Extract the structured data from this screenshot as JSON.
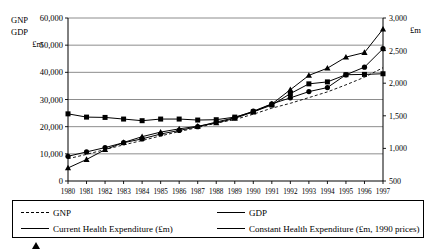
{
  "chart_data": {
    "type": "line",
    "title": "",
    "xlabel": "",
    "ylabel": "GNP GDP £m",
    "ylabel_right": "£m",
    "grid": true,
    "legend_position": "bottom",
    "x": [
      "1980",
      "1981",
      "1982",
      "1983",
      "1984",
      "1985",
      "1986",
      "1987",
      "1988",
      "1989",
      "1990",
      "1991",
      "1992",
      "1993",
      "1994",
      "1995",
      "1996",
      "1997"
    ],
    "left_axis": {
      "label_lines": [
        "GNP",
        "GDP",
        "£m"
      ],
      "ticks": [
        "0",
        "10,000",
        "20,000",
        "30,000",
        "40,000",
        "50,000",
        "60,000"
      ],
      "min": 0,
      "max": 60000,
      "step": 10000,
      "unit": "£m"
    },
    "right_axis": {
      "label": "£m",
      "ticks": [
        "500",
        "1,000",
        "1,500",
        "2,000",
        "2,500",
        "3,000"
      ],
      "min": 500,
      "max": 3000,
      "step": 500,
      "unit": "£m"
    },
    "series": [
      {
        "name": "GNP",
        "axis": "left",
        "marker": "none",
        "line_style": "dashed",
        "values": [
          8200,
          9800,
          11600,
          13300,
          14900,
          16600,
          18200,
          19700,
          21300,
          22600,
          24600,
          26800,
          28600,
          30700,
          32800,
          35400,
          38200,
          41700
        ]
      },
      {
        "name": "GDP",
        "axis": "left",
        "marker": "diamond",
        "line_style": "solid",
        "values": [
          9100,
          10700,
          12300,
          14100,
          15500,
          17300,
          18600,
          20000,
          21700,
          23300,
          25700,
          28400,
          30600,
          32900,
          34400,
          39100,
          41900,
          48700
        ]
      },
      {
        "name": "Current Health Expenditure (£m)",
        "axis": "right",
        "marker": "triangle",
        "line_style": "solid",
        "values": [
          700,
          830,
          980,
          1090,
          1180,
          1250,
          1300,
          1340,
          1390,
          1460,
          1560,
          1680,
          1900,
          2120,
          2230,
          2400,
          2470,
          2830
        ]
      },
      {
        "name": "Constant Health Expenditure (£m, 1990 prices)",
        "axis": "right",
        "marker": "square",
        "line_style": "solid",
        "values": [
          1530,
          1480,
          1475,
          1450,
          1425,
          1450,
          1450,
          1435,
          1440,
          1480,
          1560,
          1665,
          1840,
          1990,
          2020,
          2130,
          2135,
          2145
        ]
      }
    ]
  },
  "legend": {
    "items": [
      {
        "label": "GNP",
        "marker": "none",
        "line_style": "dashed"
      },
      {
        "label": "GDP",
        "marker": "diamond",
        "line_style": "solid"
      },
      {
        "label": "Current Health Expenditure (£m)",
        "marker": "triangle",
        "line_style": "solid"
      },
      {
        "label": "Constant Health Expenditure (£m, 1990 prices)",
        "marker": "square",
        "line_style": "solid"
      }
    ]
  },
  "colors": {
    "ink": "#000000",
    "grid": "#808080",
    "background": "#ffffff"
  }
}
